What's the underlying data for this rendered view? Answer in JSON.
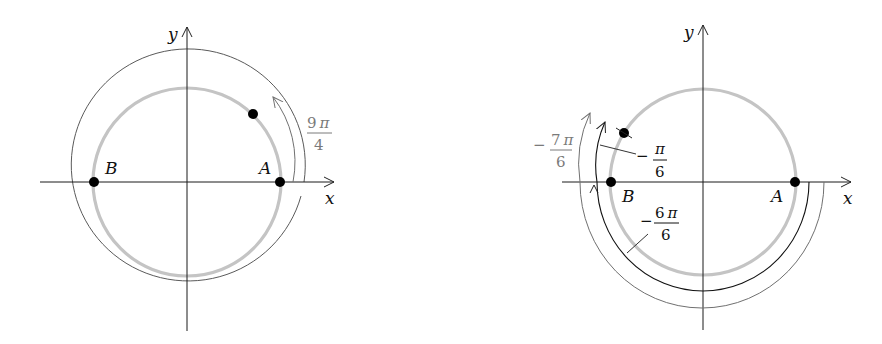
{
  "left_diagram": {
    "axes": {
      "x_label": "x",
      "y_label": "y"
    },
    "points": {
      "A": "A",
      "B": "B"
    },
    "angle_label": {
      "numerator": "9",
      "pi": "π",
      "denominator": "4"
    },
    "colors": {
      "unit_circle": "#c4c4c4",
      "angle_arc": "#707070",
      "label": "#7a7a7a"
    }
  },
  "right_diagram": {
    "axes": {
      "x_label": "x",
      "y_label": "y"
    },
    "points": {
      "A": "A",
      "B": "B"
    },
    "angle_labels": {
      "neg_7pi_6": {
        "sign": "−",
        "numerator": "7",
        "pi": "π",
        "denominator": "6"
      },
      "neg_pi_6": {
        "sign": "−",
        "numerator": "",
        "pi": "π",
        "denominator": "6"
      },
      "neg_6pi_6": {
        "sign": "−",
        "numerator": "6",
        "pi": "π",
        "denominator": "6"
      }
    },
    "colors": {
      "unit_circle": "#c4c4c4",
      "outer_arc": "#707070",
      "inner_arc": "#111111"
    }
  }
}
